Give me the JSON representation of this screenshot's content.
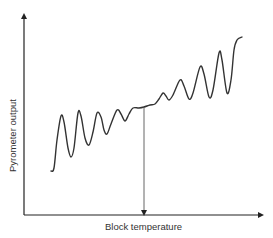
{
  "chart_data": {
    "type": "line",
    "title": "",
    "xlabel": "Block temperature",
    "ylabel": "Pyrometer output",
    "grid": false,
    "legend": null,
    "axis_ticks": "none",
    "series": [
      {
        "name": "Pyrometer output vs block temperature",
        "description": "Oscillating curve: oscillations decay toward a plateau near the marked temperature, then grow again with increasing temperature while the mean rises",
        "points_px": [
          [
            51,
            171
          ],
          [
            54,
            168
          ],
          [
            57,
            140
          ],
          [
            61,
            116
          ],
          [
            64,
            122
          ],
          [
            68,
            148
          ],
          [
            71,
            157
          ],
          [
            74,
            148
          ],
          [
            78,
            113
          ],
          [
            81,
            116
          ],
          [
            85,
            138
          ],
          [
            89,
            145
          ],
          [
            93,
            132
          ],
          [
            97,
            113
          ],
          [
            101,
            117
          ],
          [
            104,
            130
          ],
          [
            107,
            134
          ],
          [
            111,
            124
          ],
          [
            117,
            110
          ],
          [
            121,
            114
          ],
          [
            125,
            121
          ],
          [
            129,
            114
          ],
          [
            133,
            108
          ],
          [
            139,
            108
          ],
          [
            144,
            107
          ],
          [
            150,
            105
          ],
          [
            155,
            104
          ],
          [
            159,
            99
          ],
          [
            163,
            93
          ],
          [
            166,
            96
          ],
          [
            169,
            100
          ],
          [
            173,
            95
          ],
          [
            180,
            80
          ],
          [
            184,
            86
          ],
          [
            189,
            99
          ],
          [
            193,
            93
          ],
          [
            200,
            67
          ],
          [
            204,
            74
          ],
          [
            209,
            97
          ],
          [
            213,
            90
          ],
          [
            219,
            53
          ],
          [
            222,
            60
          ],
          [
            227,
            93
          ],
          [
            231,
            80
          ],
          [
            234,
            50
          ],
          [
            237,
            40
          ],
          [
            242,
            37
          ]
        ]
      }
    ],
    "annotations": [
      {
        "type": "vertical-arrow",
        "description": "Arrow dropping from the plateau point of the curve down to the temperature axis",
        "x_px": 144,
        "from_y_px": 107,
        "to_y_px": 214
      }
    ]
  },
  "axes": {
    "y_label": "Pyrometer output",
    "x_label": "Block temperature"
  },
  "colors": {
    "curve": "#333333",
    "axes": "#222222",
    "marker_line": "#555555",
    "background": "#ffffff"
  }
}
